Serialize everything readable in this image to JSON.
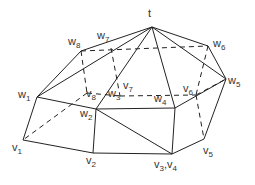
{
  "diagram": {
    "type": "polyhedron-graph",
    "apex": {
      "label": "t"
    },
    "upper_vertices": [
      {
        "base": "w",
        "sub": "1"
      },
      {
        "base": "w",
        "sub": "2"
      },
      {
        "base": "w",
        "sub": "3"
      },
      {
        "base": "w",
        "sub": "4"
      },
      {
        "base": "w",
        "sub": "5"
      },
      {
        "base": "w",
        "sub": "6"
      },
      {
        "base": "w",
        "sub": "7"
      },
      {
        "base": "w",
        "sub": "8"
      }
    ],
    "lower_vertices": [
      {
        "base": "v",
        "sub": "1"
      },
      {
        "base": "v",
        "sub": "2"
      },
      {
        "base": "v",
        "sub": "3"
      },
      {
        "base": "v",
        "sub": "4"
      },
      {
        "base": "v",
        "sub": "5"
      },
      {
        "base": "v",
        "sub": "6"
      },
      {
        "base": "v",
        "sub": "7"
      },
      {
        "base": "v",
        "sub": "8"
      }
    ],
    "separator": ","
  }
}
